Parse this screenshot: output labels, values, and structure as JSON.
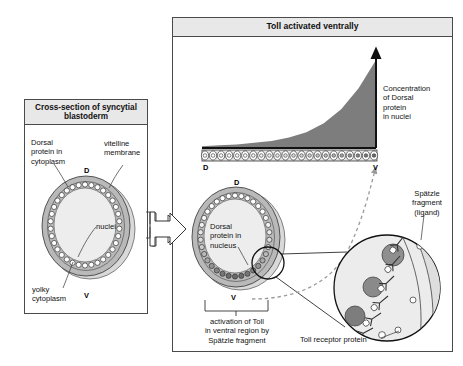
{
  "figure": {
    "title_left": "Cross-section of syncytial blastoderm",
    "title_right": "Toll activated ventrally",
    "domain": "biology-diagram"
  },
  "colors": {
    "panel_border": "#4a4a4a",
    "header_fill": "#e8e8e8",
    "page_background": "#ffffff",
    "cytoplasm_gray": "#b9b9b9",
    "yolk_fill": "#ededed",
    "membrane_gray": "#d6d6d6",
    "gradient_fill": "#7d7d7d",
    "nucleus_dark": "#6e6e6e",
    "dashed_arrow": "#9a9a9a",
    "text": "#111111"
  },
  "left_panel": {
    "header": "Cross-section of syncytial blastoderm",
    "labels": {
      "dorsal_protein": "Dorsal\nprotein in\ncytoplasm",
      "vitelline": "vitelline\nmembrane",
      "nuclei": "nuclei",
      "yolky": "yolky\ncytoplasm"
    },
    "axis": {
      "dorsal": "D",
      "ventral": "V"
    },
    "embryo": {
      "nuclei_count": 34,
      "nuclei_shaded": false,
      "description": "oval syncytial blastoderm with peripheral ring of nuclei, uniform Dorsal protein in cytoplasm"
    }
  },
  "transition": {
    "arrow": "block-arrow-right"
  },
  "right_panel": {
    "header": "Toll activated ventrally",
    "gradient_label": "Concentration\nof Dorsal\nprotein\nin nuclei",
    "axis_strip": {
      "dorsal": "D",
      "ventral": "V",
      "cells": 22
    },
    "embryo": {
      "label": "Dorsal\nprotein in\nnucleus",
      "axis": {
        "dorsal": "D",
        "ventral": "V"
      },
      "nuclei_count": 34,
      "nuclei_shaded": true,
      "shading_note": "nuclei darken progressively toward ventral side"
    },
    "bracket_caption": "activation of Toll\nin ventral region by\nSpätzle fragment",
    "inset": {
      "ligand_label": "Spätzle\nfragment\n(ligand)",
      "receptor_label": "Toll receptor protein",
      "nuclei_count": 3,
      "receptor_count": 7,
      "description": "magnified view of ventral membrane showing Toll receptors bound by Spätzle ligand and darkened nuclei"
    }
  },
  "chart_data": {
    "type": "area",
    "title": "Concentration of Dorsal protein in nuclei",
    "xlabel": "",
    "ylabel": "Concentration of Dorsal protein in nuclei",
    "x_axis_endpoints": [
      "D",
      "V"
    ],
    "categories": [
      "D",
      "",
      "",
      "",
      "",
      "",
      "",
      "",
      "",
      "",
      "V"
    ],
    "values": [
      0.02,
      0.03,
      0.04,
      0.06,
      0.08,
      0.12,
      0.18,
      0.28,
      0.44,
      0.68,
      1.0
    ],
    "ylim": [
      0,
      1.0
    ],
    "grid": false,
    "legend": "none",
    "annotations": [
      "Concentration of Dorsal protein in nuclei"
    ]
  }
}
